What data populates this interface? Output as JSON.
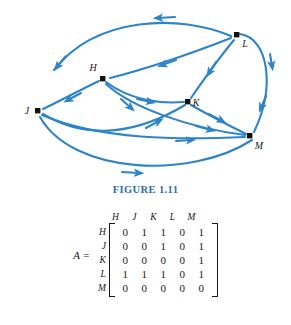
{
  "figure": {
    "caption": "FIGURE 1.11",
    "caption_color": "#2E6DA4",
    "edge_color": "#2E84C8",
    "node_color": "#111111",
    "nodes": [
      {
        "id": "H",
        "label": "H",
        "x": 103,
        "y": 79
      },
      {
        "id": "J",
        "label": "J",
        "x": 38,
        "y": 111
      },
      {
        "id": "K",
        "label": "K",
        "x": 188,
        "y": 102
      },
      {
        "id": "L",
        "label": "L",
        "x": 237,
        "y": 35
      },
      {
        "id": "M",
        "label": "M",
        "x": 250,
        "y": 136
      }
    ],
    "edges": [
      {
        "from": "H",
        "to": "J"
      },
      {
        "from": "H",
        "to": "K"
      },
      {
        "from": "H",
        "to": "M"
      },
      {
        "from": "J",
        "to": "K"
      },
      {
        "from": "J",
        "to": "M"
      },
      {
        "from": "K",
        "to": "M"
      },
      {
        "from": "L",
        "to": "H"
      },
      {
        "from": "L",
        "to": "J"
      },
      {
        "from": "L",
        "to": "K"
      },
      {
        "from": "L",
        "to": "M"
      }
    ]
  },
  "matrix": {
    "equation_label": "A =",
    "column_headers": [
      "H",
      "J",
      "K",
      "L",
      "M"
    ],
    "row_labels": [
      "H",
      "J",
      "K",
      "L",
      "M"
    ],
    "rows": [
      [
        0,
        1,
        1,
        0,
        1
      ],
      [
        0,
        0,
        1,
        0,
        1
      ],
      [
        0,
        0,
        0,
        0,
        1
      ],
      [
        1,
        1,
        1,
        0,
        1
      ],
      [
        0,
        0,
        0,
        0,
        0
      ]
    ]
  }
}
